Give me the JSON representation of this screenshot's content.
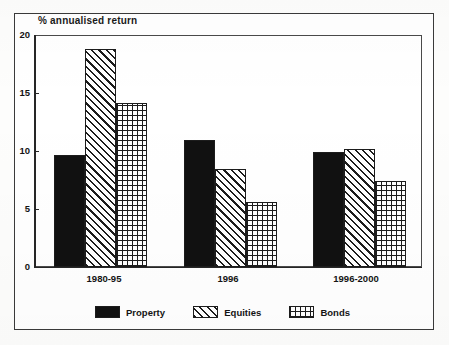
{
  "chart_data": {
    "type": "bar",
    "title": "% annualised return",
    "xlabel": "",
    "ylabel": "% annualised return",
    "ylim": [
      0,
      20
    ],
    "yticks": [
      0,
      5,
      10,
      15,
      20
    ],
    "ytick_labels": [
      "0",
      "5",
      "10",
      "15",
      "20"
    ],
    "grid": false,
    "legend_position": "bottom",
    "categories": [
      "1980-95",
      "1996",
      "1996-2000"
    ],
    "series": [
      {
        "name": "Property",
        "pattern": "solid-black",
        "color": "#111111",
        "values": [
          9.6,
          10.9,
          9.9
        ]
      },
      {
        "name": "Equities",
        "pattern": "diagonal-hatch",
        "color": "#1c1c1c",
        "values": [
          18.8,
          8.4,
          10.1
        ]
      },
      {
        "name": "Bonds",
        "pattern": "cross-hatch",
        "color": "#1c1c1c",
        "values": [
          14.1,
          5.6,
          7.4
        ]
      }
    ]
  },
  "axis": {
    "y_ticks": [
      {
        "label": "20",
        "value": 20
      },
      {
        "label": "15",
        "value": 15
      },
      {
        "label": "10",
        "value": 10
      },
      {
        "label": "5",
        "value": 5
      },
      {
        "label": "0",
        "value": 0
      }
    ],
    "x_categories": [
      {
        "label": "1980-95"
      },
      {
        "label": "1996"
      },
      {
        "label": "1996-2000"
      }
    ]
  },
  "legend": {
    "items": [
      {
        "label": "Property",
        "pattern": "solid-black"
      },
      {
        "label": "Equities",
        "pattern": "diagonal-hatch"
      },
      {
        "label": "Bonds",
        "pattern": "cross-hatch"
      }
    ]
  },
  "colors": {
    "ink": "#1c1c1c",
    "frame": "#3a3a3a",
    "paper": "#ffffff"
  }
}
